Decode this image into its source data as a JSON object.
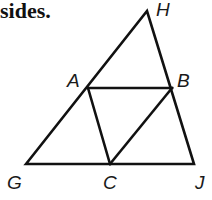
{
  "caption": "sides.",
  "figure": {
    "stroke_color": "#111111",
    "points": {
      "H": {
        "label": "H",
        "x": 147,
        "y": 11
      },
      "A": {
        "label": "A",
        "x": 88,
        "y": 88
      },
      "B": {
        "label": "B",
        "x": 172,
        "y": 88
      },
      "G": {
        "label": "G",
        "x": 26,
        "y": 164
      },
      "C": {
        "label": "C",
        "x": 110,
        "y": 164
      },
      "J": {
        "label": "J",
        "x": 194,
        "y": 164
      }
    },
    "segments": [
      "GH",
      "HJ",
      "GJ",
      "AB",
      "AC",
      "BC"
    ]
  }
}
